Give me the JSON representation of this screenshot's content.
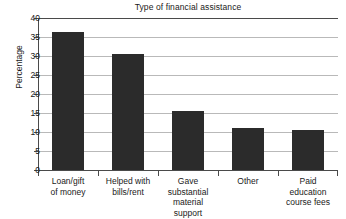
{
  "chart_data": {
    "type": "bar",
    "title": "Type of financial assistance",
    "xlabel": "",
    "ylabel": "Percentage",
    "categories": [
      "Loan/gift of money",
      "Helped with bills/rent",
      "Gave substantial material support",
      "Other",
      "Paid education course fees"
    ],
    "category_lines": [
      [
        "Loan/gift",
        "of money"
      ],
      [
        "Helped with",
        "bills/rent"
      ],
      [
        "Gave",
        "substantial",
        "material",
        "support"
      ],
      [
        "Other"
      ],
      [
        "Paid",
        "education",
        "course fees"
      ]
    ],
    "values": [
      36.3,
      30.5,
      15.6,
      11.0,
      10.4
    ],
    "ylim": [
      0,
      40
    ],
    "yticks": [
      40,
      35,
      30,
      25,
      20,
      15,
      10,
      5,
      0
    ],
    "ytick_labels": [
      "40",
      "35",
      "30",
      "25",
      "20",
      "15",
      "10",
      "5",
      "0"
    ],
    "grid": true,
    "legend": false,
    "bar_color": "#2b2b2b",
    "grid_color": "#b9b9b9",
    "axis_color": "#4a4a4a",
    "background_color": "#ffffff"
  }
}
